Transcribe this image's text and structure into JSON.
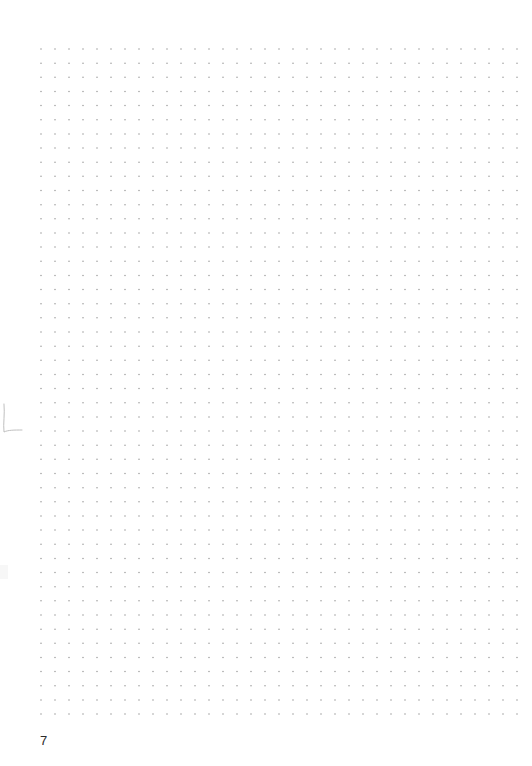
{
  "page": {
    "type": "dot-grid notebook page",
    "page_number": "7",
    "background_color": "#ffffff",
    "text_color": "#2b2b2b"
  },
  "grid": {
    "columns": 35,
    "rows": 48,
    "origin_x": 41,
    "origin_y": 49,
    "spacing_x": 14.0,
    "spacing_y": 14.15,
    "dot_radius": 0.75,
    "dot_color": "#9a9a9a"
  },
  "marks": {
    "left_edge_pencil_mark": "faint hand-drawn stroke at left margin",
    "mark_color": "#b8b8b8"
  }
}
